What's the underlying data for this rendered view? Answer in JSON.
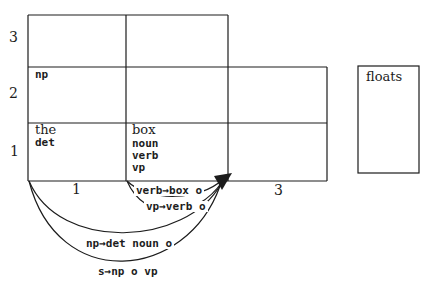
{
  "figure_type": "chart-parsing-diagram",
  "colors": {
    "ink": "#1c1c1c",
    "background": "#ffffff"
  },
  "chart": {
    "row_labels": [
      "3",
      "2",
      "1"
    ],
    "col_labels": [
      "1",
      "3"
    ],
    "cells": {
      "row2_col1": {
        "category": "np"
      },
      "row1_col1": {
        "word": "the",
        "categories": [
          "det"
        ]
      },
      "row1_col2": {
        "word": "box",
        "categories": [
          "noun",
          "verb",
          "vp"
        ]
      }
    },
    "pending_input": {
      "word": "floats"
    }
  },
  "edges": [
    {
      "label": "verb→box o"
    },
    {
      "label": "vp→verb o"
    },
    {
      "label": "np→det noun o"
    },
    {
      "label": "s→np o vp"
    }
  ]
}
